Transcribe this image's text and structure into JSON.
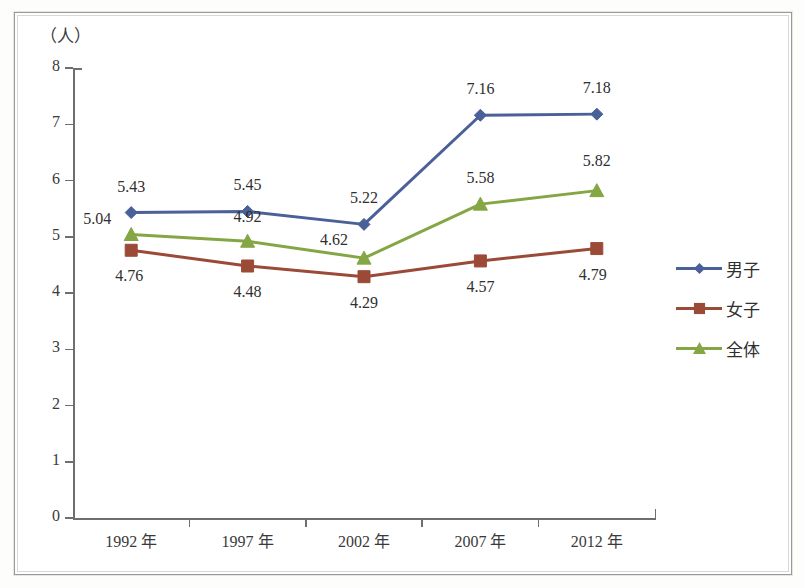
{
  "figure": {
    "unit_label": "（人）",
    "background": "#ffffff",
    "frame_color": "#9a9a9a"
  },
  "chart_data": {
    "type": "line",
    "title": "",
    "subtitle": "",
    "xlabel": "",
    "ylabel": "（人）",
    "categories": [
      "1992 年",
      "1997 年",
      "2002 年",
      "2007 年",
      "2012 年"
    ],
    "x_tick_labels": [
      "1992 年",
      "1997 年",
      "2002 年",
      "2007 年",
      "2012 年"
    ],
    "y_tick_labels": [
      "8",
      "7",
      "6",
      "5",
      "4",
      "3",
      "2",
      "1",
      "0"
    ],
    "ylim": [
      0,
      8
    ],
    "y_tick_step": 1,
    "grid": false,
    "legend_position": "right",
    "series": [
      {
        "name": "男子",
        "color": "#4a6098",
        "marker": "diamond",
        "values": [
          5.43,
          5.45,
          5.22,
          7.16,
          7.18
        ],
        "labels": [
          "5.43",
          "5.45",
          "5.22",
          "7.16",
          "7.18"
        ]
      },
      {
        "name": "女子",
        "color": "#9c4a38",
        "marker": "square",
        "values": [
          4.76,
          4.48,
          4.29,
          4.57,
          4.79
        ],
        "labels": [
          "4.76",
          "4.48",
          "4.29",
          "4.57",
          "4.79"
        ]
      },
      {
        "name": "全体",
        "color": "#84a644",
        "marker": "triangle",
        "values": [
          5.04,
          4.92,
          4.62,
          5.58,
          5.82
        ],
        "labels": [
          "5.04",
          "4.92",
          "4.62",
          "5.58",
          "5.82"
        ]
      }
    ]
  },
  "legend": {
    "items": [
      {
        "label": "男子",
        "color": "#4a6098",
        "marker": "diamond"
      },
      {
        "label": "女子",
        "color": "#9c4a38",
        "marker": "square"
      },
      {
        "label": "全体",
        "color": "#84a644",
        "marker": "triangle"
      }
    ]
  }
}
